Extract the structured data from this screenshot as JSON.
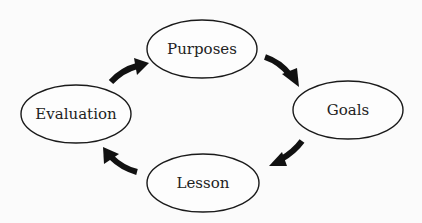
{
  "diagram": {
    "type": "cycle",
    "direction": "clockwise",
    "colors": {
      "background": "#fbfbfb",
      "stroke": "#1a1a1a",
      "arrow": "#111111",
      "text": "#222222"
    },
    "nodes": [
      {
        "id": "purposes",
        "label": "Purposes",
        "cx": 202,
        "cy": 49,
        "rx": 55,
        "ry": 29
      },
      {
        "id": "goals",
        "label": "Goals",
        "cx": 348,
        "cy": 110,
        "rx": 55,
        "ry": 29
      },
      {
        "id": "lesson",
        "label": "Lesson",
        "cx": 203,
        "cy": 183,
        "rx": 56,
        "ry": 29
      },
      {
        "id": "evaluation",
        "label": "Evaluation",
        "cx": 76,
        "cy": 114,
        "rx": 55,
        "ry": 29
      }
    ],
    "edges": [
      {
        "from": "purposes",
        "to": "goals"
      },
      {
        "from": "goals",
        "to": "lesson"
      },
      {
        "from": "lesson",
        "to": "evaluation"
      },
      {
        "from": "evaluation",
        "to": "purposes"
      }
    ]
  }
}
